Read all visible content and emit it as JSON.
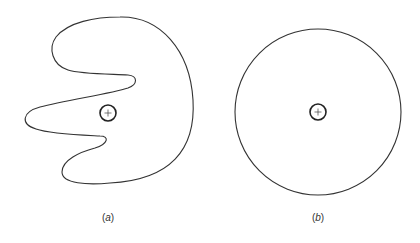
{
  "figure": {
    "panels": [
      {
        "id": "a",
        "label_open": "(",
        "label_letter": "a",
        "label_close": ")",
        "shape": "irregular-blob",
        "marker": "+"
      },
      {
        "id": "b",
        "label_open": "(",
        "label_letter": "b",
        "label_close": ")",
        "shape": "circle",
        "marker": "+"
      }
    ],
    "colors": {
      "outline": "#333333",
      "background": "#ffffff"
    }
  }
}
